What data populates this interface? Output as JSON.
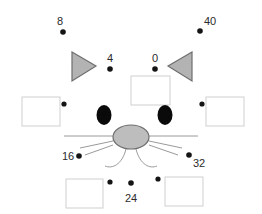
{
  "figure": {
    "background_color": "#ffffff"
  },
  "colors": {
    "dot": "#141414",
    "label_text": "#2b2b2b",
    "box_fill": "#ffffff",
    "box_stroke": "#cfcfcf",
    "ear_fill": "#b3b3b3",
    "ear_stroke": "#6e6e6e",
    "eye_fill": "#0a0a0a",
    "nose_fill": "#bdbdbd",
    "nose_stroke": "#6e6e6e",
    "whisker_stroke": "#9a9a9a"
  },
  "labeled_points": [
    {
      "label": "8",
      "dot_x": 63,
      "dot_y": 32,
      "label_x": 57,
      "label_y": 25
    },
    {
      "label": "40",
      "dot_x": 200,
      "dot_y": 31,
      "label_x": 204,
      "label_y": 25
    },
    {
      "label": "4",
      "dot_x": 110,
      "dot_y": 69,
      "label_x": 107,
      "label_y": 62
    },
    {
      "label": "0",
      "dot_x": 155,
      "dot_y": 69,
      "label_x": 152,
      "label_y": 62
    },
    {
      "label": "16",
      "dot_x": 79,
      "dot_y": 156,
      "label_x": 62,
      "label_y": 160
    },
    {
      "label": "32",
      "dot_x": 189,
      "dot_y": 155,
      "label_x": 193,
      "label_y": 167
    },
    {
      "label": "24",
      "dot_x": 131,
      "dot_y": 183,
      "label_x": 125,
      "label_y": 202
    }
  ],
  "unlabeled_dots": [
    {
      "dot_x": 64,
      "dot_y": 104
    },
    {
      "dot_x": 202,
      "dot_y": 104
    },
    {
      "dot_x": 110,
      "dot_y": 182
    },
    {
      "dot_x": 158,
      "dot_y": 179
    }
  ],
  "boxes": [
    {
      "name": "box-top-center",
      "x": 131,
      "y": 76,
      "w": 39,
      "h": 29
    },
    {
      "name": "box-left",
      "x": 22,
      "y": 97,
      "w": 38,
      "h": 29
    },
    {
      "name": "box-right",
      "x": 206,
      "y": 97,
      "w": 38,
      "h": 29
    },
    {
      "name": "box-bottom-left",
      "x": 66,
      "y": 179,
      "w": 37,
      "h": 29
    },
    {
      "name": "box-bottom-right",
      "x": 165,
      "y": 177,
      "w": 38,
      "h": 29
    }
  ],
  "ears": [
    {
      "name": "ear-left",
      "points": "72,52 96,66 72,81"
    },
    {
      "name": "ear-right",
      "points": "192,52 168,66 192,81"
    }
  ],
  "eyes": [
    {
      "name": "eye-left",
      "cx": 104,
      "cy": 115,
      "rx": 7.5,
      "ry": 10
    },
    {
      "name": "eye-right",
      "cx": 165,
      "cy": 115,
      "rx": 7.5,
      "ry": 10
    }
  ],
  "nose": {
    "cx": 131,
    "cy": 137,
    "rx": 18,
    "ry": 12
  },
  "muzzle_line": {
    "x1": 64,
    "y1": 136,
    "x2": 198,
    "y2": 136
  },
  "whiskers": [
    {
      "x1": 113,
      "y1": 141,
      "x2": 80,
      "y2": 148
    },
    {
      "x1": 113,
      "y1": 145,
      "x2": 85,
      "y2": 155
    },
    {
      "x1": 149,
      "y1": 141,
      "x2": 182,
      "y2": 148
    },
    {
      "x1": 149,
      "y1": 145,
      "x2": 178,
      "y2": 155
    }
  ],
  "mouth": [
    {
      "path": "M 126 149 C 122 165, 112 169, 105 166"
    },
    {
      "path": "M 136 149 C 140 165, 150 169, 157 166"
    }
  ]
}
